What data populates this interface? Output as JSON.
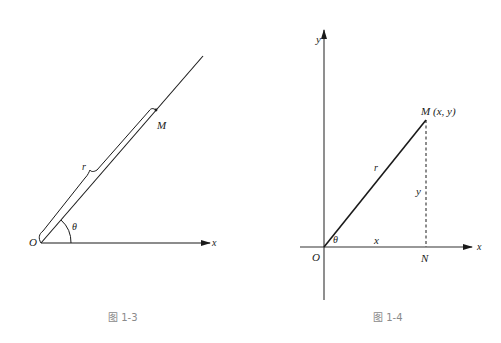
{
  "figures": [
    {
      "id": "fig-1-3",
      "caption": "图 1-3",
      "labels": {
        "origin": "O",
        "point": "M",
        "radius": "r",
        "angle": "θ",
        "x_axis": "x"
      }
    },
    {
      "id": "fig-1-4",
      "caption": "图 1-4",
      "labels": {
        "origin": "O",
        "point": "M",
        "point_coords": "(x, y)",
        "radius": "r",
        "angle": "θ",
        "x_axis": "x",
        "y_axis": "y",
        "foot": "N",
        "x_leg": "x",
        "y_leg": "y"
      }
    }
  ],
  "colors": {
    "stroke": "#1a1a1a",
    "caption": "#8a8a8a",
    "background": "#ffffff"
  }
}
